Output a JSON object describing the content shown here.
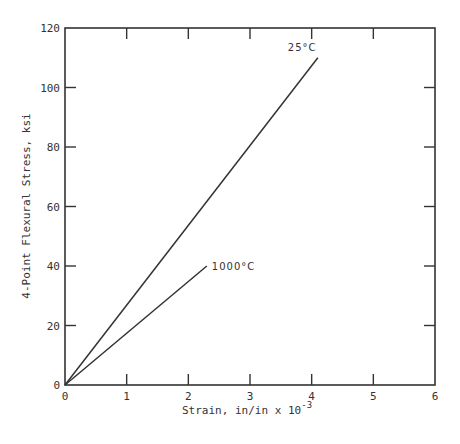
{
  "chart_data": {
    "type": "line",
    "title": "",
    "xlabel": "Strain, in/in x 10",
    "xlabel_exponent": "-3",
    "ylabel": "4-Point Flexural Stress, ksi",
    "xlim": [
      0,
      6
    ],
    "ylim": [
      0,
      120
    ],
    "x_ticks": [
      "0",
      "1",
      "2",
      "3",
      "4",
      "5",
      "6"
    ],
    "y_ticks": [
      "0",
      "20",
      "40",
      "60",
      "80",
      "100",
      "120"
    ],
    "grid": false,
    "legend": "inline labels at line ends",
    "series": [
      {
        "name": "25°C",
        "x": [
          0,
          4.1
        ],
        "y": [
          0,
          110
        ]
      },
      {
        "name": "1000°C",
        "x": [
          0,
          2.3
        ],
        "y": [
          0,
          40
        ]
      }
    ]
  },
  "colors": {
    "line": "#333333",
    "axis": "#333333",
    "background": "#ffffff"
  }
}
